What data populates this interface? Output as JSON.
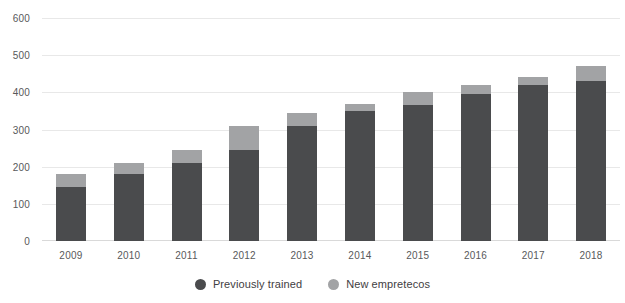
{
  "chart_data": {
    "type": "bar",
    "subtype": "stacked-vertical",
    "title": "",
    "subtitle": "",
    "xlabel": "",
    "ylabel": "",
    "categories": [
      "2009",
      "2010",
      "2011",
      "2012",
      "2013",
      "2014",
      "2015",
      "2016",
      "2017",
      "2018"
    ],
    "series": [
      {
        "name": "Previously trained",
        "color": "#4a4b4d",
        "values": [
          145,
          180,
          210,
          245,
          310,
          350,
          365,
          395,
          420,
          430
        ]
      },
      {
        "name": "New empretecos",
        "color": "#a2a3a5",
        "values": [
          35,
          30,
          35,
          65,
          35,
          20,
          35,
          25,
          20,
          40
        ]
      }
    ],
    "totals": [
      180,
      210,
      245,
      310,
      345,
      370,
      400,
      420,
      440,
      470
    ],
    "ylim": [
      0,
      600
    ],
    "yticks": [
      0,
      100,
      200,
      300,
      400,
      500,
      600
    ],
    "ytick_labels": [
      "0",
      "100",
      "200",
      "300",
      "400",
      "500",
      "600"
    ],
    "grid": true,
    "grid_axis": "y",
    "legend_position": "bottom-center",
    "stacked": true,
    "background": "#ffffff"
  },
  "legend": {
    "items": [
      {
        "label": "Previously trained",
        "color": "#4a4b4d"
      },
      {
        "label": "New empretecos",
        "color": "#a2a3a5"
      }
    ]
  }
}
